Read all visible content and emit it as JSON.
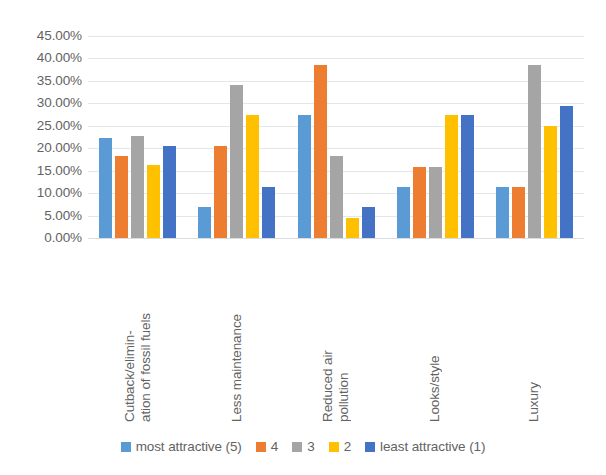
{
  "chart_data": {
    "type": "bar",
    "title": "",
    "xlabel": "",
    "ylabel": "",
    "ylim": [
      0,
      45
    ],
    "grid": true,
    "legend_position": "bottom",
    "categories": [
      "Cutback/elimin-\nation of fossil fuels",
      "Less maintenance",
      "Reduced air\npollution",
      "Looks/style",
      "Luxury"
    ],
    "category_lines": [
      [
        "Cutback/elimin-",
        "ation of fossil fuels"
      ],
      [
        "Less maintenance"
      ],
      [
        "Reduced air",
        "pollution"
      ],
      [
        "Looks/style"
      ],
      [
        "Luxury"
      ]
    ],
    "ytick_labels": [
      "45.00%",
      "40.00%",
      "35.00%",
      "30.00%",
      "25.00%",
      "20.00%",
      "15.00%",
      "10.00%",
      "5.00%",
      "0.00%"
    ],
    "ytick_values": [
      45,
      40,
      35,
      30,
      25,
      20,
      15,
      10,
      5,
      0
    ],
    "series": [
      {
        "name": "most attractive (5)",
        "color": "#5B9BD5",
        "values": [
          22.3,
          6.9,
          27.3,
          11.4,
          11.4
        ]
      },
      {
        "name": "4",
        "color": "#ED7D31",
        "values": [
          18.3,
          20.5,
          38.6,
          15.9,
          11.4
        ]
      },
      {
        "name": "3",
        "color": "#A5A5A5",
        "values": [
          22.7,
          34.1,
          18.2,
          15.9,
          38.6
        ]
      },
      {
        "name": "2",
        "color": "#FFC000",
        "values": [
          16.3,
          27.3,
          4.5,
          27.3,
          25.0
        ]
      },
      {
        "name": "least attractive (1)",
        "color": "#4472C4",
        "values": [
          20.5,
          11.4,
          6.8,
          27.3,
          29.5
        ]
      }
    ]
  }
}
